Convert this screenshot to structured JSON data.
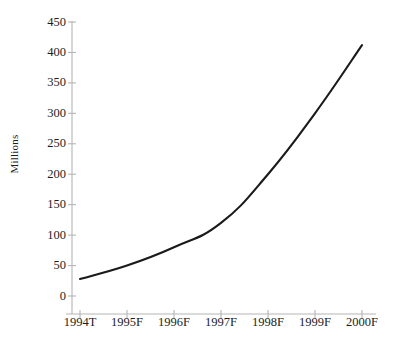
{
  "chart_data": {
    "type": "line",
    "title": "",
    "subtitle": "",
    "xlabel": "",
    "ylabel": "Millions",
    "categories": [
      "1994T",
      "1995F",
      "1996F",
      "1997F",
      "1998F",
      "1999F",
      "2000F"
    ],
    "values": [
      28,
      50,
      80,
      120,
      200,
      300,
      412
    ],
    "series": [
      {
        "name": "Millions",
        "values": [
          28,
          50,
          80,
          120,
          200,
          300,
          412
        ]
      }
    ],
    "ylim": [
      0,
      450
    ],
    "y_ticks": [
      0,
      50,
      100,
      150,
      200,
      250,
      300,
      350,
      400,
      450
    ],
    "y_tick_labels": [
      "0",
      "50",
      "100",
      "150",
      "200",
      "250",
      "300",
      "350",
      "400",
      "450"
    ],
    "grid": false,
    "legend": "none",
    "line_color": "#1a1a1a",
    "axis_color": "#b5b5b5",
    "background_color": "#ffffff",
    "markers": false
  },
  "axes": {
    "y_title": "Millions"
  }
}
